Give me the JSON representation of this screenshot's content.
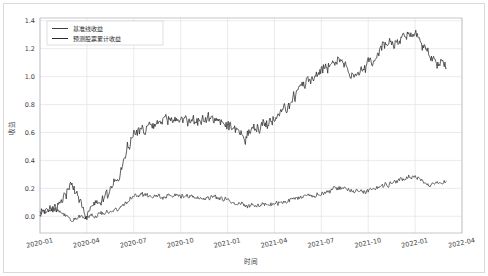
{
  "chart_data": {
    "type": "line",
    "title": "",
    "xlabel": "时间",
    "ylabel": "收益",
    "grid": true,
    "legend_position": "upper left",
    "xlim": [
      "2020-01-01",
      "2022-04-01"
    ],
    "ylim": [
      -0.12,
      1.42
    ],
    "yticks": [
      "0.0",
      "0.2",
      "0.4",
      "0.6",
      "0.8",
      "1.0",
      "1.2",
      "1.4"
    ],
    "ytick_values": [
      0.0,
      0.2,
      0.4,
      0.6,
      0.8,
      1.0,
      1.2,
      1.4
    ],
    "xticks": [
      "2020-01",
      "2020-04",
      "2020-07",
      "2020-10",
      "2021-01",
      "2021-04",
      "2021-07",
      "2021-10",
      "2022-01",
      "2022-04"
    ],
    "series": [
      {
        "name": "基准线收益",
        "color": "#3f3f3f",
        "linewidth": 0.75,
        "x": [
          "2020-01",
          "2020-02",
          "2020-03",
          "2020-04",
          "2020-05",
          "2020-06",
          "2020-07",
          "2020-08",
          "2020-09",
          "2020-10",
          "2020-11",
          "2020-12",
          "2021-01",
          "2021-02",
          "2021-03",
          "2021-04",
          "2021-05",
          "2021-06",
          "2021-07",
          "2021-08",
          "2021-09",
          "2021-10",
          "2021-11",
          "2021-12",
          "2022-01",
          "2022-02",
          "2022-03"
        ],
        "values": [
          0.02,
          0.05,
          -0.02,
          0.0,
          0.02,
          0.05,
          0.15,
          0.15,
          0.14,
          0.15,
          0.13,
          0.14,
          0.12,
          0.08,
          0.08,
          0.09,
          0.11,
          0.14,
          0.16,
          0.2,
          0.19,
          0.18,
          0.22,
          0.26,
          0.29,
          0.22,
          0.25
        ]
      },
      {
        "name": "预测股票累计收益",
        "color": "#2b2b2b",
        "linewidth": 0.85,
        "x": [
          "2020-01",
          "2020-02",
          "2020-03",
          "2020-04",
          "2020-05",
          "2020-06",
          "2020-07",
          "2020-08",
          "2020-09",
          "2020-10",
          "2020-11",
          "2020-12",
          "2021-01",
          "2021-02",
          "2021-03",
          "2021-04",
          "2021-05",
          "2021-06",
          "2021-07",
          "2021-08",
          "2021-09",
          "2021-10",
          "2021-11",
          "2021-12",
          "2022-01",
          "2022-02",
          "2022-03"
        ],
        "values": [
          0.03,
          0.08,
          0.22,
          0.02,
          0.12,
          0.28,
          0.6,
          0.62,
          0.69,
          0.7,
          0.68,
          0.7,
          0.66,
          0.56,
          0.64,
          0.68,
          0.8,
          0.97,
          1.05,
          1.12,
          1.02,
          1.08,
          1.22,
          1.26,
          1.31,
          1.14,
          1.06
        ]
      }
    ],
    "annotations": {
      "peak_predicted": 1.33,
      "final_predicted": 1.06,
      "final_benchmark": 0.25,
      "max_benchmark": 0.3,
      "min_predicted": -0.09
    }
  },
  "legend": {
    "entries": [
      {
        "label": "基准线收益"
      },
      {
        "label": "预测股票累计收益"
      }
    ]
  }
}
